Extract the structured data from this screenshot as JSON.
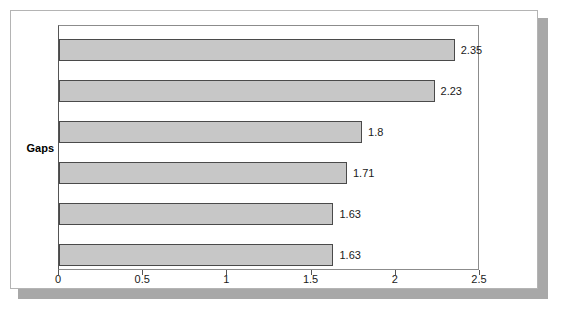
{
  "chart_data": {
    "type": "bar",
    "orientation": "horizontal",
    "title": "",
    "subtitle": "",
    "xlabel": "",
    "ylabel": "Gaps",
    "categories": [
      "Gaps",
      "Gaps",
      "Gaps",
      "Gaps",
      "Gaps",
      "Gaps"
    ],
    "values": [
      2.35,
      2.23,
      1.8,
      1.71,
      1.63,
      1.63
    ],
    "data_labels": [
      "2.35",
      "2.23",
      "1.8",
      "1.71",
      "1.63",
      "1.63"
    ],
    "xlim": [
      0,
      2.5
    ],
    "xticks": [
      0,
      0.5,
      1,
      1.5,
      2,
      2.5
    ],
    "xtick_labels": [
      "0",
      "0.5",
      "1",
      "1.5",
      "2",
      "2.5"
    ],
    "grid": false,
    "legend": false,
    "legend_position": "none",
    "series": [
      {
        "name": "Gaps",
        "values": [
          2.35,
          2.23,
          1.8,
          1.71,
          1.63,
          1.63
        ]
      }
    ]
  },
  "axis": {
    "category_label": "Gaps",
    "tick_labels": [
      "0",
      "0.5",
      "1",
      "1.5",
      "2",
      "2.5"
    ]
  },
  "bars": [
    {
      "value": 2.35,
      "label": "2.35"
    },
    {
      "value": 2.23,
      "label": "2.23"
    },
    {
      "value": 1.8,
      "label": "1.8"
    },
    {
      "value": 1.71,
      "label": "1.71"
    },
    {
      "value": 1.63,
      "label": "1.63"
    },
    {
      "value": 1.63,
      "label": "1.63"
    }
  ],
  "colors": {
    "bar_fill": "#c7c7c7",
    "bar_stroke": "#4a4a4a",
    "axis": "#555555",
    "text": "#1a1a1a",
    "frame": "#b4b4b4",
    "shadow": "#a8a8a8",
    "background": "#ffffff"
  }
}
